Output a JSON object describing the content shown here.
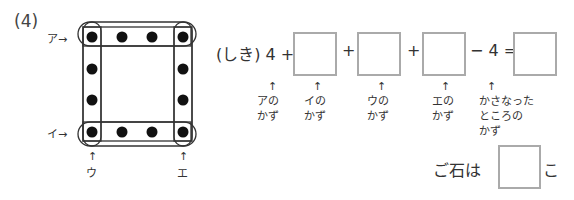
{
  "problem_number": "(4)",
  "diagram": {
    "row_labels": [
      "ア→",
      "イ→"
    ],
    "col_labels": [
      "ウ",
      "エ"
    ],
    "up_arrow": "↑",
    "stone_color": "#111111"
  },
  "equation": {
    "prefix": "(しき) 4 +",
    "plus": "+",
    "minus_part": "− 4 =",
    "up_arrow": "↑",
    "captions": [
      "アの\nかず",
      "イの\nかず",
      "ウの\nかず",
      "エの\nかず",
      "かさなった\nところの\nかず"
    ]
  },
  "answer": {
    "prefix": "ご石は",
    "suffix": "こ"
  }
}
